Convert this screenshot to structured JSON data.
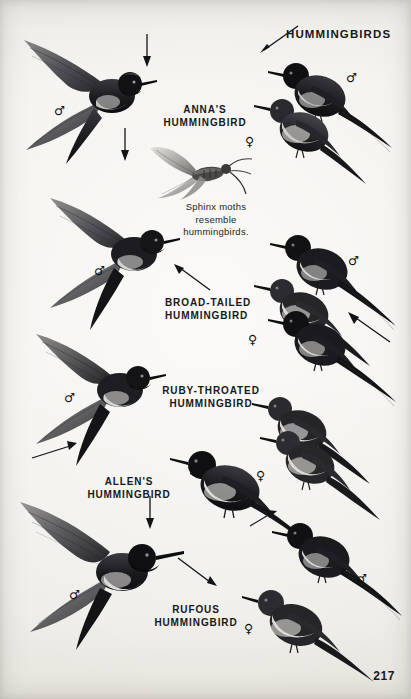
{
  "page": {
    "header": "HUMMINGBIRDS",
    "page_number": "217",
    "background_color": "#f2f0ec",
    "ink_color": "#17181a"
  },
  "caption": {
    "line1": "Sphinx moths",
    "line2": "resemble",
    "line3": "hummingbirds."
  },
  "species": [
    {
      "id": "annas",
      "line1": "ANNA'S",
      "line2": "HUMMINGBIRD"
    },
    {
      "id": "broad-tailed",
      "line1": "BROAD-TAILED",
      "line2": "HUMMINGBIRD"
    },
    {
      "id": "ruby-throated",
      "line1": "RUBY-THROATED",
      "line2": "HUMMINGBIRD"
    },
    {
      "id": "allens",
      "line1": "ALLEN'S",
      "line2": "HUMMINGBIRD"
    },
    {
      "id": "rufous",
      "line1": "RUFOUS",
      "line2": "HUMMINGBIRD"
    }
  ],
  "symbols": {
    "male": "♂",
    "female": "♀"
  }
}
